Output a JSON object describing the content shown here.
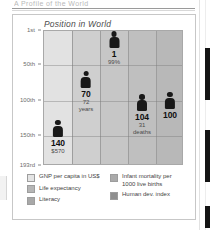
{
  "page": {
    "clipped_heading_text": "A Profile of the World",
    "scrollbar": "vertical-scrollbar"
  },
  "figure": {
    "title": "Position in World"
  },
  "chart_data": {
    "type": "bar",
    "title": "Position in World",
    "xlabel": "",
    "ylabel": "Position in World",
    "grid": true,
    "legend_position": "bottom",
    "yaxis": {
      "ticks": [
        "1st",
        "50th",
        "100th",
        "150th",
        "193rd"
      ],
      "tick_values": [
        1,
        50,
        100,
        150,
        193
      ],
      "inverted": true,
      "ylim": [
        1,
        193
      ]
    },
    "categories": [
      "GNP per capita in US$",
      "Life expectancy",
      "Literacy",
      "Infant mortality per 1000 live births",
      "Human dev. index"
    ],
    "values": [
      140,
      70,
      1,
      104,
      100
    ],
    "annotations": [
      "$570",
      "72 years",
      "99%",
      "31 deaths",
      ""
    ],
    "points": [
      {
        "category": "GNP per capita in US$",
        "rank": "140",
        "rank_value": 140,
        "sub_line1": "$570",
        "sub_line2": "",
        "column_color": "#e2e2e2"
      },
      {
        "category": "Life expectancy",
        "rank": "70",
        "rank_value": 70,
        "sub_line1": "72",
        "sub_line2": "years",
        "column_color": "#cfcfcf"
      },
      {
        "category": "Literacy",
        "rank": "1",
        "rank_value": 1,
        "sub_line1": "99%",
        "sub_line2": "",
        "column_color": "#c6c6c6"
      },
      {
        "category": "Infant mortality per 1000 live births",
        "rank": "104",
        "rank_value": 104,
        "sub_line1": "31",
        "sub_line2": "deaths",
        "column_color": "#bfbfbf"
      },
      {
        "category": "Human dev. index",
        "rank": "100",
        "rank_value": 100,
        "sub_line1": "",
        "sub_line2": "",
        "column_color": "#b8b8b8"
      }
    ],
    "legend": [
      {
        "label": "GNP per capita in US$",
        "color": "#e4e4e4"
      },
      {
        "label": "Life expectancy",
        "color": "#b6b6b6"
      },
      {
        "label": "Literacy",
        "color": "#a8a8a8"
      },
      {
        "label": "Infant mortality per 1000 live births",
        "color": "#aaaaaa"
      },
      {
        "label": "Human dev. index",
        "color": "#8f8f8f"
      }
    ]
  }
}
